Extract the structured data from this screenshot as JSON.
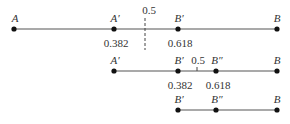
{
  "diagram": {
    "rows": [
      {
        "y": 29,
        "x_start": 14,
        "x_end": 277,
        "points": [
          {
            "label": "A",
            "x": 14
          },
          {
            "label": "A′",
            "x": 114,
            "value": "0.382"
          },
          {
            "label": "B′",
            "x": 178,
            "value": "0.618"
          },
          {
            "label": "B",
            "x": 277
          }
        ],
        "midpoint": {
          "label": "0.5",
          "x": 145,
          "style": "dashed"
        }
      },
      {
        "y": 71,
        "x_start": 114,
        "x_end": 277,
        "points": [
          {
            "label": "A′",
            "x": 114
          },
          {
            "label": "B′",
            "x": 178,
            "value": "0.382"
          },
          {
            "label": "B″",
            "x": 216,
            "value": "0.618"
          },
          {
            "label": "B",
            "x": 277
          }
        ],
        "midpoint": {
          "label": "0.5",
          "x": 197,
          "style": "tick"
        }
      },
      {
        "y": 110,
        "x_start": 178,
        "x_end": 277,
        "points": [
          {
            "label": "B′",
            "x": 178
          },
          {
            "label": "B″",
            "x": 216
          },
          {
            "label": "B",
            "x": 277
          }
        ]
      }
    ],
    "colors": {
      "line": "#555555",
      "dot": "#111111",
      "text": "#333333"
    }
  }
}
